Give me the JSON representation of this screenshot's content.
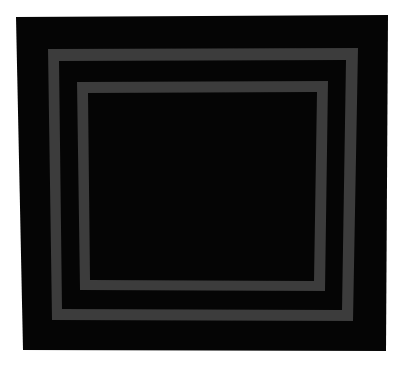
{
  "image": {
    "subject": "quilt",
    "description": "Black square quilt with two concentric gray rectangular borders",
    "colors": {
      "background": "#ffffff",
      "quilt_body": "#050505",
      "border_bands": "#3c3c3c"
    }
  }
}
